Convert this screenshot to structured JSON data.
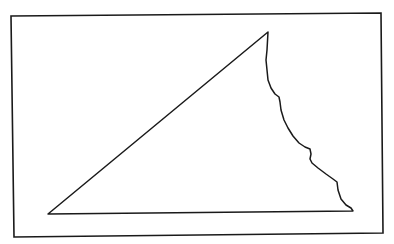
{
  "diagram": {
    "background": "#ffffff",
    "stroke": "#1a1a1a",
    "frame": {
      "points": "11,16 381,13 383,233 14,237",
      "stroke_width": 1.6
    },
    "shape": {
      "label": "irregular triangle with jagged right edge",
      "points": "48,214 268,32 267,50 266,60 267,70 268,80 271,88 275,94 279,97 280,102 281,110 284,120 288,128 293,136 299,143 305,147 310,149 311,154 310,159 312,163 318,168 326,174 333,179 337,182 338,190 341,199 346,205 351,208 353,211",
      "stroke_width": 1.5
    }
  }
}
